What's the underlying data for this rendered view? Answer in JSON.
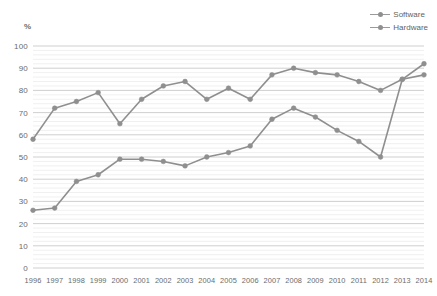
{
  "chart_data": {
    "type": "line",
    "title": "",
    "xlabel": "",
    "ylabel": "%",
    "ylim": [
      0,
      100
    ],
    "ytick_step": 10,
    "grid": true,
    "minor_grid": true,
    "legend_position": "top-right",
    "categories": [
      "1996",
      "1997",
      "1998",
      "1999",
      "2000",
      "2001",
      "2002",
      "2003",
      "2004",
      "2005",
      "2006",
      "2007",
      "2008",
      "2009",
      "2010",
      "2011",
      "2012",
      "2013",
      "2014"
    ],
    "series": [
      {
        "name": "Software",
        "color": "#8f8f8f",
        "values": [
          58,
          72,
          75,
          79,
          65,
          76,
          82,
          84,
          76,
          81,
          76,
          87,
          90,
          88,
          87,
          84,
          80,
          85,
          92
        ]
      },
      {
        "name": "Hardware",
        "color": "#8f8f8f",
        "values": [
          26,
          27,
          39,
          42,
          49,
          49,
          48,
          46,
          50,
          52,
          55,
          67,
          72,
          68,
          62,
          57,
          50,
          85,
          87
        ]
      }
    ],
    "yticks": [
      "0",
      "10",
      "20",
      "30",
      "40",
      "50",
      "60",
      "70",
      "80",
      "90",
      "100"
    ]
  },
  "legend": {
    "items": [
      {
        "label": "Software"
      },
      {
        "label": "Hardware"
      }
    ]
  },
  "axis": {
    "y_unit_label": "%"
  }
}
